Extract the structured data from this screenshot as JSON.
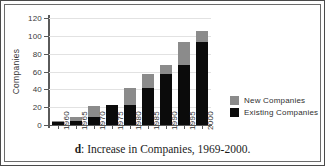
{
  "chart_data": {
    "type": "bar",
    "stacked": true,
    "title": "",
    "caption_prefix": "d",
    "caption": ": Increase in Companies, 1969-2000.",
    "caption_full": "d: Increase in Companies, 1969-2000.",
    "xlabel": "",
    "ylabel": "Companies",
    "ylim": [
      0,
      120
    ],
    "yticks": [
      0,
      20,
      40,
      60,
      80,
      100,
      120
    ],
    "grid": true,
    "legend_position": "right",
    "categories": [
      "1960",
      "1965",
      "1970",
      "1975",
      "1980",
      "1985",
      "1990",
      "1995",
      "2000"
    ],
    "series": [
      {
        "name": "Existing Companies",
        "color": "#0b0b0b",
        "values": [
          3,
          4,
          9,
          22,
          23,
          41,
          57,
          67,
          93
        ]
      },
      {
        "name": "New Companies",
        "color": "#8b8b8b",
        "values": [
          1,
          5,
          12,
          0,
          18,
          16,
          10,
          26,
          12
        ]
      }
    ],
    "totals": [
      4,
      9,
      21,
      22,
      41,
      57,
      67,
      93,
      105
    ]
  },
  "legend": {
    "items": [
      {
        "label": "New Companies",
        "color": "#8b8b8b"
      },
      {
        "label": "Existing Companies",
        "color": "#0b0b0b"
      }
    ]
  }
}
